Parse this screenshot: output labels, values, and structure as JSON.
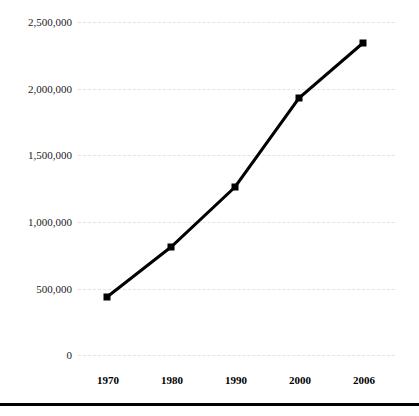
{
  "chart_data": {
    "type": "line",
    "title": "",
    "subtitle": "",
    "xlabel": "",
    "ylabel": "",
    "categories": [
      "1970",
      "1980",
      "1990",
      "2000",
      "2006"
    ],
    "x": [
      1970,
      1980,
      1990,
      2000,
      2006
    ],
    "values": [
      460000,
      830000,
      1290000,
      1950000,
      2360000
    ],
    "series": [
      {
        "name": "",
        "values": [
          460000,
          830000,
          1290000,
          1950000,
          2360000
        ]
      }
    ],
    "ylim": [
      0,
      2500000
    ],
    "ytick_values": [
      0,
      500000,
      1000000,
      1500000,
      2000000,
      2500000
    ],
    "ytick_labels": [
      "0",
      "500,000",
      "1,000,000",
      "1,500,000",
      "2,000,000",
      "2,500,000"
    ],
    "xtick_labels": [
      "1970",
      "1980",
      "1990",
      "2000",
      "2006"
    ],
    "grid": true,
    "grid_axis": "y",
    "grid_style": "dashed",
    "legend": false,
    "legend_position": "none",
    "annotations": [],
    "marker": "square",
    "line_color": "#000000",
    "marker_color": "#000000",
    "grid_color": "#e3e3e3",
    "background_color": "#ffffff"
  },
  "axes": {
    "y_ticks": [
      {
        "label": "2,500,000",
        "value": 2500000,
        "y": 22
      },
      {
        "label": "2,000,000",
        "value": 2000000,
        "y": 89
      },
      {
        "label": "1,500,000",
        "value": 1500000,
        "y": 155
      },
      {
        "label": "1,000,000",
        "value": 1000000,
        "y": 222
      },
      {
        "label": "500,000",
        "value": 500000,
        "y": 289
      },
      {
        "label": "0",
        "value": 0,
        "y": 355
      }
    ],
    "x_ticks": [
      {
        "label": "1970",
        "x": 108
      },
      {
        "label": "1980",
        "x": 172
      },
      {
        "label": "1990",
        "x": 236
      },
      {
        "label": "2000",
        "x": 300
      },
      {
        "label": "2006",
        "x": 364
      }
    ]
  },
  "points": [
    {
      "label": "1970",
      "value": 460000,
      "x": 107,
      "y": 297
    },
    {
      "label": "1980",
      "value": 830000,
      "x": 171,
      "y": 247
    },
    {
      "label": "1990",
      "value": 1290000,
      "x": 235,
      "y": 187
    },
    {
      "label": "2000",
      "value": 1950000,
      "x": 299,
      "y": 98
    },
    {
      "label": "2006",
      "value": 2360000,
      "x": 363,
      "y": 43
    }
  ],
  "polyline": "107,297 171,247 235,187 299,98 363,43",
  "footer": {
    "rule": ""
  }
}
